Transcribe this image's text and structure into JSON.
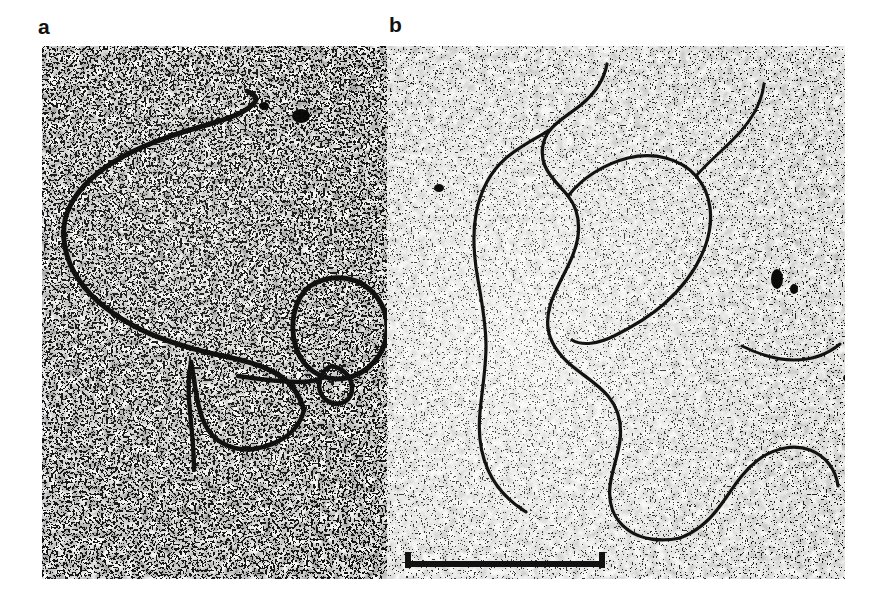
{
  "figure": {
    "type": "electron-micrograph",
    "panel_count": 2,
    "background_color": "#ffffff",
    "plate": {
      "x": 42,
      "y": 46,
      "width": 803,
      "height": 533,
      "film_base_color": "#f2f2f0",
      "grain_color": "#141414"
    }
  },
  "labels": {
    "panel_a": "a",
    "panel_b": "b"
  },
  "panels": [
    {
      "id": "a",
      "label": "a",
      "region": {
        "x": 42,
        "y": 46,
        "width": 345,
        "height": 533
      },
      "description": "Left electron micrograph panel, coarse dark grain, contains a long open DNA duplex strand and a small closed circular loop",
      "contrast": "high",
      "grain": "coarse",
      "features": [
        {
          "name": "dna-strand-main",
          "kind": "filament",
          "description": "long curved open DNA strand running from upper-centre leftwards then down"
        },
        {
          "name": "dna-loop-circular",
          "kind": "loop",
          "description": "closed circular DNA loop in lower-right of panel a"
        },
        {
          "name": "dna-loop-small",
          "kind": "loop",
          "description": "small secondary loop beneath the circular loop"
        },
        {
          "name": "dna-tail-lower-left",
          "kind": "filament",
          "description": "strand tail extending to lower-left corner"
        },
        {
          "name": "dark-speck",
          "kind": "artifact",
          "description": "dense black stain speck, upper centre-right"
        }
      ]
    },
    {
      "id": "b",
      "label": "b",
      "region": {
        "x": 387,
        "y": 46,
        "width": 458,
        "height": 533
      },
      "description": "Right electron micrograph panel, finer and lighter grain, contains a long branched DNA molecule with a large open loop",
      "contrast": "medium",
      "grain": "fine",
      "features": [
        {
          "name": "dna-strand-main",
          "kind": "filament",
          "description": "long sinuous DNA strand descending from top centre to bottom right"
        },
        {
          "name": "dna-loop-large",
          "kind": "loop",
          "description": "large open loop in the upper-right half of panel b"
        },
        {
          "name": "dna-branch-left",
          "kind": "filament",
          "description": "left branch descending steeply to the lower-left"
        },
        {
          "name": "dna-branch-lower-right",
          "kind": "filament",
          "description": "looping branch in the lower-right quadrant"
        },
        {
          "name": "dark-speck",
          "kind": "artifact",
          "description": "dense black stain specks near the right edge"
        }
      ]
    }
  ],
  "scale_bar": {
    "visible": true,
    "label": "",
    "x": 405,
    "y": 564,
    "length_px": 200,
    "thickness_px": 6,
    "has_end_ticks": true,
    "end_tick_height_px": 16,
    "color": "#111111"
  },
  "caption_remnant": {
    "visible": true,
    "text": "",
    "note": "bottom of a cut-off caption line, barely visible"
  },
  "colors": {
    "page_background": "#ffffff",
    "ink": "#111111",
    "film_light": "#f4f4f2",
    "film_mid": "#cfcfcb",
    "film_dark": "#1a1a1a"
  }
}
